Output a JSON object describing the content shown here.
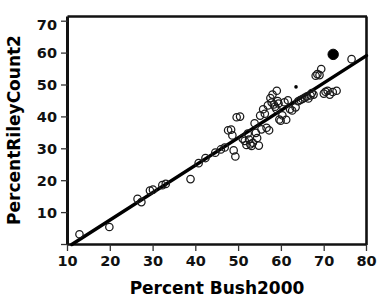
{
  "chart_data": {
    "type": "scatter",
    "title": "",
    "xlabel": "Percent Bush2000",
    "ylabel": "PercentRileyCount2",
    "xlim": [
      10.5,
      80
    ],
    "ylim": [
      9,
      72.5
    ],
    "xticks": [
      10,
      20,
      30,
      40,
      50,
      60,
      70,
      80
    ],
    "yticks": [
      10,
      20,
      30,
      40,
      50,
      60,
      70
    ],
    "grid": false,
    "legend": "none",
    "frame": "box",
    "series": [
      {
        "name": "counties",
        "marker": "open-circle",
        "marker_color": "#1a1a1a",
        "points": [
          [
            12.8,
            13.2
          ],
          [
            19.8,
            15.5
          ],
          [
            26.4,
            24.3
          ],
          [
            27.3,
            23.3
          ],
          [
            29.3,
            26.9
          ],
          [
            30.0,
            27.2
          ],
          [
            32.2,
            28.6
          ],
          [
            33.0,
            29.0
          ],
          [
            38.8,
            30.5
          ],
          [
            40.7,
            35.5
          ],
          [
            42.3,
            37.1
          ],
          [
            44.6,
            38.8
          ],
          [
            45.9,
            39.8
          ],
          [
            46.8,
            40.4
          ],
          [
            47.6,
            45.8
          ],
          [
            48.3,
            46.0
          ],
          [
            48.6,
            44.2
          ],
          [
            48.9,
            39.5
          ],
          [
            49.3,
            37.6
          ],
          [
            49.6,
            49.9
          ],
          [
            50.4,
            50.1
          ],
          [
            51.0,
            43.2
          ],
          [
            51.5,
            42.5
          ],
          [
            51.9,
            41.2
          ],
          [
            52.2,
            44.8
          ],
          [
            52.5,
            42.9
          ],
          [
            52.8,
            41.4
          ],
          [
            53.1,
            40.9
          ],
          [
            53.4,
            41.9
          ],
          [
            53.8,
            48.0
          ],
          [
            54.1,
            45.0
          ],
          [
            54.4,
            43.4
          ],
          [
            54.8,
            41.0
          ],
          [
            55.1,
            50.4
          ],
          [
            55.4,
            46.1
          ],
          [
            55.8,
            52.4
          ],
          [
            56.2,
            51.0
          ],
          [
            56.6,
            46.6
          ],
          [
            56.9,
            53.6
          ],
          [
            57.2,
            45.8
          ],
          [
            57.5,
            55.9
          ],
          [
            57.8,
            54.5
          ],
          [
            58.0,
            57.0
          ],
          [
            58.3,
            53.9
          ],
          [
            58.6,
            53.2
          ],
          [
            58.9,
            52.5
          ],
          [
            59.0,
            58.2
          ],
          [
            59.2,
            55.0
          ],
          [
            59.4,
            54.2
          ],
          [
            59.6,
            49.2
          ],
          [
            59.9,
            48.8
          ],
          [
            60.3,
            50.5
          ],
          [
            60.8,
            54.6
          ],
          [
            61.2,
            49.1
          ],
          [
            61.6,
            55.2
          ],
          [
            62.1,
            52.4
          ],
          [
            62.6,
            52.0
          ],
          [
            63.4,
            53.0
          ],
          [
            64.0,
            54.9
          ],
          [
            64.5,
            55.3
          ],
          [
            65.0,
            55.6
          ],
          [
            65.5,
            56.0
          ],
          [
            66.0,
            56.4
          ],
          [
            66.4,
            55.8
          ],
          [
            66.9,
            56.7
          ],
          [
            67.2,
            57.5
          ],
          [
            67.6,
            57.0
          ],
          [
            68.1,
            62.9
          ],
          [
            68.5,
            63.4
          ],
          [
            69.0,
            63.1
          ],
          [
            69.4,
            65.0
          ],
          [
            70.0,
            57.3
          ],
          [
            70.4,
            57.9
          ],
          [
            70.9,
            58.2
          ],
          [
            71.4,
            57.0
          ],
          [
            72.1,
            57.8
          ],
          [
            73.0,
            58.2
          ],
          [
            76.5,
            68.1
          ]
        ]
      },
      {
        "name": "highlighted-county",
        "marker": "filled-circle",
        "marker_color": "#000000",
        "points": [
          [
            72.2,
            69.6
          ]
        ]
      },
      {
        "name": "small-point",
        "marker": "small-dot",
        "marker_color": "#000000",
        "points": [
          [
            63.5,
            59.4
          ]
        ]
      }
    ],
    "fit_line": {
      "name": "regression-line",
      "color": "#000000",
      "x": [
        11.0,
        80.0
      ],
      "y": [
        10.0,
        69.2
      ]
    }
  }
}
